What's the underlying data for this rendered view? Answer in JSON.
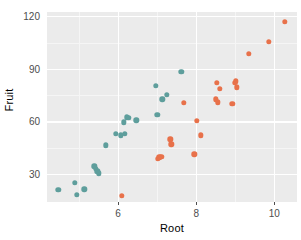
{
  "chart_data": {
    "type": "scatter",
    "title": "",
    "xlabel": "Root",
    "ylabel": "Fruit",
    "xlim": [
      4.18,
      10.58
    ],
    "ylim": [
      14.0,
      122.5
    ],
    "xticks": [
      6,
      8,
      10
    ],
    "yticks": [
      30,
      60,
      90,
      120
    ],
    "xticks_minor": [
      5,
      7,
      9
    ],
    "yticks_minor": [
      45,
      75,
      105
    ],
    "grid": true,
    "legend": "none",
    "panel_background": "#ebebeb",
    "gridline_color": "#ffffff",
    "series": [
      {
        "name": "group-teal",
        "color": "#5e9e9c",
        "points": [
          {
            "x": 4.47,
            "y": 21.1
          },
          {
            "x": 4.89,
            "y": 25.0
          },
          {
            "x": 4.95,
            "y": 18.0
          },
          {
            "x": 5.13,
            "y": 21.3
          },
          {
            "x": 5.39,
            "y": 34.3
          },
          {
            "x": 5.43,
            "y": 33.0
          },
          {
            "x": 5.47,
            "y": 31.6
          },
          {
            "x": 5.51,
            "y": 30.5
          },
          {
            "x": 5.68,
            "y": 46.3
          },
          {
            "x": 5.94,
            "y": 53.0
          },
          {
            "x": 6.07,
            "y": 52.0
          },
          {
            "x": 6.14,
            "y": 59.6
          },
          {
            "x": 6.17,
            "y": 52.8
          },
          {
            "x": 6.23,
            "y": 62.4
          },
          {
            "x": 6.27,
            "y": 62.0
          },
          {
            "x": 6.47,
            "y": 60.6
          },
          {
            "x": 6.97,
            "y": 80.5
          },
          {
            "x": 7.0,
            "y": 63.8
          },
          {
            "x": 7.13,
            "y": 72.6
          },
          {
            "x": 7.24,
            "y": 75.2
          },
          {
            "x": 7.62,
            "y": 88.4
          }
        ]
      },
      {
        "name": "group-orange",
        "color": "#e8714a",
        "points": [
          {
            "x": 6.1,
            "y": 17.6
          },
          {
            "x": 7.02,
            "y": 38.6
          },
          {
            "x": 7.05,
            "y": 39.5
          },
          {
            "x": 7.11,
            "y": 39.8
          },
          {
            "x": 7.34,
            "y": 49.8
          },
          {
            "x": 7.36,
            "y": 47.0
          },
          {
            "x": 7.68,
            "y": 70.5
          },
          {
            "x": 7.95,
            "y": 41.2
          },
          {
            "x": 8.02,
            "y": 60.5
          },
          {
            "x": 8.12,
            "y": 52.2
          },
          {
            "x": 8.5,
            "y": 72.6
          },
          {
            "x": 8.53,
            "y": 82.0
          },
          {
            "x": 8.55,
            "y": 70.9
          },
          {
            "x": 8.61,
            "y": 78.6
          },
          {
            "x": 8.92,
            "y": 70.0
          },
          {
            "x": 8.98,
            "y": 82.0
          },
          {
            "x": 9.02,
            "y": 83.0
          },
          {
            "x": 9.04,
            "y": 79.5
          },
          {
            "x": 9.35,
            "y": 98.5
          },
          {
            "x": 9.86,
            "y": 105.5
          },
          {
            "x": 10.26,
            "y": 116.8
          }
        ]
      }
    ]
  }
}
